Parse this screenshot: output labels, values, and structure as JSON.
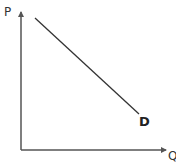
{
  "diagram": {
    "title": "",
    "type": "demand-curve",
    "axes": {
      "y_label": "P",
      "x_label": "Q"
    },
    "curves": [
      {
        "label": "D",
        "from": [
          35,
          18
        ],
        "to": [
          139,
          114
        ],
        "color": "#333333"
      }
    ],
    "colors": {
      "axis": "#555555",
      "curve": "#333333",
      "background": "#ffffff"
    }
  }
}
